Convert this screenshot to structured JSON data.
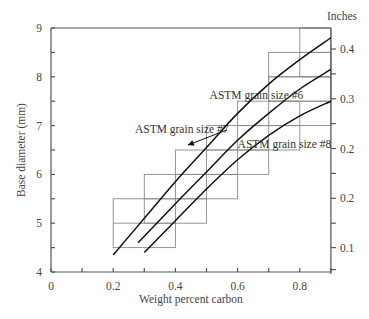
{
  "chart_data": {
    "type": "line",
    "title": "",
    "xlabel": "Weight percent carbon",
    "ylabel": "Base diameter (mm)",
    "y2label": "Inches",
    "xlim": [
      0,
      0.9
    ],
    "ylim": [
      4,
      9
    ],
    "x_ticks": [
      0,
      0.2,
      0.4,
      0.6,
      0.8
    ],
    "x_tick_labels": [
      "0",
      "0.2",
      "0.4",
      "0.6",
      "0.8"
    ],
    "x_minor_ticks": [
      0.1,
      0.3,
      0.5,
      0.7,
      0.9
    ],
    "y_ticks": [
      4,
      5,
      6,
      7,
      8,
      9
    ],
    "y_tick_labels": [
      "4",
      "5",
      "6",
      "7",
      "8",
      "9"
    ],
    "y_minor_ticks": [
      4.5,
      5.5,
      6.5,
      7.5,
      8.5
    ],
    "y2_ticks_mm": [
      8.57,
      7.55,
      6.53,
      5.51,
      4.5
    ],
    "y2_tick_labels": [
      "0.4",
      "0.3",
      "0.2",
      "0.2",
      "0.1"
    ],
    "y2_minor_ticks_mm": [
      8.06,
      7.04,
      6.02,
      5.0,
      4.05
    ],
    "grid": false,
    "legend": null,
    "series": [
      {
        "name": "ASTM grain size #6",
        "x": [
          0.2,
          0.3,
          0.4,
          0.5,
          0.6,
          0.7,
          0.8,
          0.9
        ],
        "y": [
          4.35,
          5.1,
          5.85,
          6.55,
          7.25,
          7.85,
          8.35,
          8.8
        ]
      },
      {
        "name": "ASTM grain size #7",
        "x": [
          0.28,
          0.4,
          0.5,
          0.6,
          0.7,
          0.8,
          0.9
        ],
        "y": [
          4.6,
          5.4,
          6.05,
          6.7,
          7.25,
          7.75,
          8.15
        ]
      },
      {
        "name": "ASTM grain size #8",
        "x": [
          0.3,
          0.4,
          0.5,
          0.6,
          0.7,
          0.8,
          0.9
        ],
        "y": [
          4.4,
          5.05,
          5.7,
          6.3,
          6.8,
          7.2,
          7.5
        ]
      }
    ],
    "boxes": [
      {
        "x0": 0.2,
        "x1": 0.4,
        "y0": 4.5,
        "y1": 5.5,
        "mid": 5.0
      },
      {
        "x0": 0.3,
        "x1": 0.5,
        "y0": 5.0,
        "y1": 6.0,
        "mid": 5.5
      },
      {
        "x0": 0.4,
        "x1": 0.6,
        "y0": 5.5,
        "y1": 6.5,
        "mid": 6.0
      },
      {
        "x0": 0.5,
        "x1": 0.7,
        "y0": 6.0,
        "y1": 7.0,
        "mid": 6.5
      },
      {
        "x0": 0.6,
        "x1": 0.8,
        "y0": 6.5,
        "y1": 7.5,
        "mid": 7.0
      },
      {
        "x0": 0.7,
        "x1": 0.9,
        "y0": 7.0,
        "y1": 8.0,
        "mid": 7.5
      },
      {
        "x0": 0.7,
        "x1": 0.9,
        "y0": 7.5,
        "y1": 8.5,
        "mid": 8.0
      },
      {
        "x0": 0.8,
        "x1": 0.9,
        "y0": 8.0,
        "y1": 9.0,
        "mid": 8.5
      }
    ],
    "annotations": [
      {
        "text": "ASTM grain size #6",
        "x": 0.51,
        "y": 7.55
      },
      {
        "text": "ASTM grain size #7",
        "x": 0.27,
        "y": 6.85,
        "arrow_to": [
          0.44,
          6.6
        ]
      },
      {
        "text": "ASTM grain size #8",
        "x": 0.6,
        "y": 6.55
      }
    ]
  }
}
